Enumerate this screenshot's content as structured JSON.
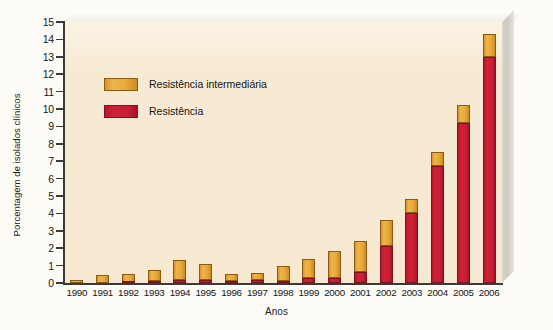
{
  "chart_data": {
    "type": "bar",
    "subtype": "stacked-column",
    "title": "",
    "xlabel": "Anos",
    "ylabel": "Porcentagem de isolados clínicos",
    "categories": [
      "1990",
      "1991",
      "1992",
      "1993",
      "1994",
      "1995",
      "1996",
      "1997",
      "1998",
      "1999",
      "2000",
      "2001",
      "2002",
      "2003",
      "2004",
      "2005",
      "2006"
    ],
    "series": [
      {
        "name": "Resistência",
        "color": "#c71f33",
        "values": [
          0.0,
          0.0,
          0.05,
          0.1,
          0.15,
          0.2,
          0.12,
          0.15,
          0.1,
          0.28,
          0.3,
          0.65,
          2.1,
          4.0,
          6.75,
          9.2,
          13.0
        ]
      },
      {
        "name": "Resistência intermediária",
        "color": "#e8a93a",
        "values": [
          0.2,
          0.45,
          0.45,
          0.62,
          1.2,
          0.88,
          0.4,
          0.45,
          0.9,
          1.1,
          1.55,
          1.75,
          1.5,
          0.85,
          0.8,
          1.05,
          1.3
        ]
      }
    ],
    "totals": [
      0.2,
      0.45,
      0.5,
      0.72,
      1.35,
      1.08,
      0.52,
      0.6,
      1.0,
      1.38,
      1.85,
      2.4,
      3.6,
      4.85,
      7.55,
      10.25,
      14.3
    ],
    "ylim": [
      0,
      15
    ],
    "yticks": [
      "0",
      "1",
      "2",
      "3",
      "4",
      "5",
      "6",
      "7",
      "8",
      "9",
      "10",
      "11",
      "12",
      "13",
      "14",
      "15"
    ],
    "grid": false,
    "legend_position": "upper-left-inside"
  },
  "axes": {
    "y_title": "Porcentagem de isolados clínicos",
    "x_title": "Anos"
  },
  "legend": {
    "items": [
      {
        "label": "Resistência intermediária",
        "swatch": "intermediate-resistance-swatch"
      },
      {
        "label": "Resistência",
        "swatch": "resistance-swatch"
      }
    ]
  },
  "colors": {
    "intermediate": "#e8a93a",
    "resistant": "#c71f33",
    "plot_background": "#f6e8d1",
    "page_background": "#fdfbf6",
    "axis": "#3a3a38"
  }
}
